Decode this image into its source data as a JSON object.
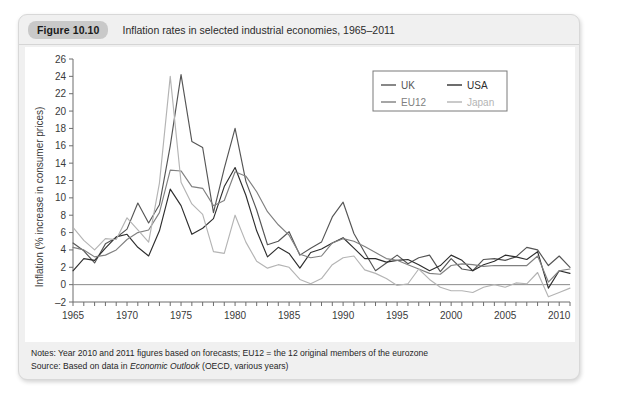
{
  "figure": {
    "badge": "Figure 10.10",
    "title": "Inflation rates in selected industrial economies, 1965–2011",
    "notes_line1": "Notes: Year 2010 and 2011 figures based on forecasts; EU12 = the 12 original members of the eurozone",
    "notes_source_prefix": "Source: Based on data in ",
    "notes_source_italic": "Economic Outlook",
    "notes_source_suffix": " (OECD, various years)"
  },
  "chart_data": {
    "type": "line",
    "title": "Inflation rates in selected industrial economies, 1965–2011",
    "xlabel": "",
    "ylabel": "Inflation (% increase in consumer prices)",
    "xlim": [
      1965,
      2011
    ],
    "ylim": [
      -2,
      26
    ],
    "yticks": [
      -2,
      0,
      2,
      4,
      6,
      8,
      10,
      12,
      14,
      16,
      18,
      20,
      22,
      24,
      26
    ],
    "xticks_major": [
      1965,
      1970,
      1975,
      1980,
      1985,
      1990,
      1995,
      2000,
      2005,
      2010
    ],
    "xtick_step_minor": 1,
    "grid": false,
    "legend_position": "top-right",
    "x": [
      1965,
      1966,
      1967,
      1968,
      1969,
      1970,
      1971,
      1972,
      1973,
      1974,
      1975,
      1976,
      1977,
      1978,
      1979,
      1980,
      1981,
      1982,
      1983,
      1984,
      1985,
      1986,
      1987,
      1988,
      1989,
      1990,
      1991,
      1992,
      1993,
      1994,
      1995,
      1996,
      1997,
      1998,
      1999,
      2000,
      2001,
      2002,
      2003,
      2004,
      2005,
      2006,
      2007,
      2008,
      2009,
      2010,
      2011
    ],
    "series": [
      {
        "name": "UK",
        "color": "#555555",
        "values": [
          4.8,
          3.9,
          2.5,
          4.7,
          5.4,
          6.4,
          9.4,
          7.1,
          9.2,
          16.0,
          24.2,
          16.5,
          15.8,
          8.3,
          13.4,
          18.0,
          11.9,
          8.6,
          4.6,
          5.0,
          6.1,
          3.4,
          4.2,
          4.9,
          7.8,
          9.5,
          5.9,
          3.7,
          1.6,
          2.5,
          3.4,
          2.4,
          3.1,
          3.4,
          1.5,
          3.0,
          1.8,
          1.6,
          2.9,
          3.0,
          2.8,
          3.2,
          4.3,
          4.0,
          2.2,
          3.3,
          2.0
        ]
      },
      {
        "name": "USA",
        "color": "#2e2e2e",
        "values": [
          1.6,
          3.0,
          2.8,
          4.2,
          5.5,
          5.8,
          4.3,
          3.3,
          6.2,
          11.0,
          9.1,
          5.8,
          6.5,
          7.6,
          11.3,
          13.5,
          10.3,
          6.2,
          3.2,
          4.3,
          3.6,
          1.9,
          3.7,
          4.1,
          4.8,
          5.4,
          4.2,
          3.0,
          3.0,
          2.6,
          2.8,
          2.9,
          2.3,
          1.6,
          2.2,
          3.4,
          2.8,
          1.6,
          2.3,
          2.7,
          3.4,
          3.2,
          2.9,
          3.8,
          -0.4,
          1.6,
          1.3
        ]
      },
      {
        "name": "EU12",
        "color": "#808080",
        "values": [
          4.3,
          4.0,
          3.2,
          3.4,
          4.0,
          5.2,
          6.0,
          6.3,
          8.3,
          13.2,
          13.1,
          11.3,
          11.1,
          9.1,
          9.7,
          13.0,
          12.5,
          10.7,
          8.4,
          6.9,
          5.7,
          3.5,
          3.1,
          3.3,
          4.8,
          5.3,
          5.0,
          4.4,
          3.7,
          3.0,
          2.8,
          2.3,
          1.8,
          1.3,
          1.2,
          2.2,
          2.4,
          2.3,
          2.1,
          2.2,
          2.2,
          2.2,
          2.2,
          3.3,
          0.3,
          1.6,
          1.8
        ]
      },
      {
        "name": "Japan",
        "color": "#b4b4b4",
        "values": [
          6.6,
          5.1,
          4.0,
          5.3,
          5.2,
          7.7,
          6.3,
          4.9,
          11.7,
          24.0,
          11.8,
          9.3,
          8.1,
          3.8,
          3.6,
          8.0,
          4.9,
          2.7,
          1.9,
          2.3,
          2.0,
          0.6,
          0.1,
          0.7,
          2.3,
          3.1,
          3.3,
          1.7,
          1.3,
          0.7,
          -0.1,
          0.1,
          1.8,
          0.6,
          -0.3,
          -0.7,
          -0.7,
          -0.9,
          -0.3,
          0.0,
          -0.3,
          0.2,
          0.1,
          1.4,
          -1.4,
          -0.9,
          -0.4
        ]
      }
    ],
    "legend": [
      {
        "label": "UK",
        "color": "#555555"
      },
      {
        "label": "USA",
        "color": "#2e2e2e"
      },
      {
        "label": "EU12",
        "color": "#808080"
      },
      {
        "label": "Japan",
        "color": "#b4b4b4"
      }
    ]
  }
}
